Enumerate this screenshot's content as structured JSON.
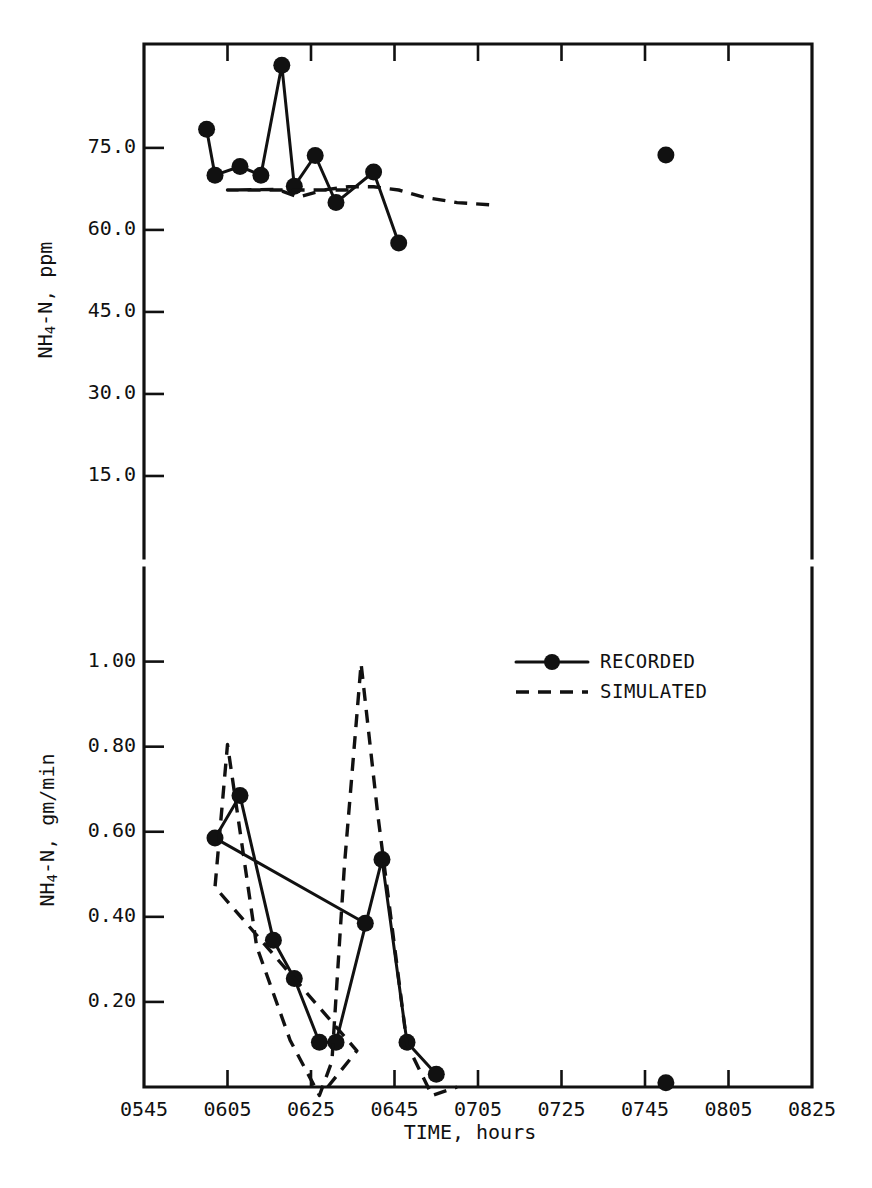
{
  "figure": {
    "background_color": "#ffffff",
    "ink_color": "#111111",
    "xlabel": "TIME, hours"
  },
  "legend": {
    "position": "upper-right-of-lower-panel",
    "entries": [
      {
        "label": "RECORDED",
        "style": "solid-with-circle-marker"
      },
      {
        "label": "SIMULATED",
        "style": "dashed"
      }
    ]
  },
  "chart_data": [
    {
      "type": "line",
      "panel": "top",
      "title": "",
      "xlabel": "",
      "ylabel": "NH4-N, ppm",
      "ylabel_parts": {
        "pre": "NH",
        "sub": "4",
        "post": "-N, ppm"
      },
      "x_tick_labels": [
        "0545",
        "0605",
        "0625",
        "0645",
        "0705",
        "0725",
        "0745",
        "0805",
        "0825"
      ],
      "x_tick_values": [
        545,
        605,
        625,
        645,
        705,
        725,
        745,
        805,
        825
      ],
      "x_ticks_visible": false,
      "y_tick_labels": [
        "75.0",
        "60.0",
        "45.0",
        "30.0",
        "15.0"
      ],
      "y_tick_values": [
        75.0,
        60.0,
        45.0,
        30.0,
        15.0
      ],
      "xlim": [
        545,
        825
      ],
      "ylim": [
        0,
        94
      ],
      "grid": false,
      "framed": true,
      "series": [
        {
          "name": "RECORDED",
          "style": "solid",
          "markers": true,
          "x": [
            600,
            602,
            608,
            613,
            618,
            621,
            626,
            631,
            640,
            646,
            652
          ],
          "y": [
            78.4,
            70.0,
            71.6,
            70.0,
            90.1,
            68.0,
            73.6,
            65.0,
            70.6,
            57.6
          ]
        },
        {
          "name": "RECORDED-isolated",
          "style": "points-only",
          "markers": true,
          "x": [
            750
          ],
          "y": [
            73.7
          ]
        },
        {
          "name": "SIMULATED",
          "style": "dashed",
          "markers": false,
          "x": [
            594,
            605,
            617,
            622,
            628,
            634,
            640,
            646,
            652,
            660,
            668
          ],
          "y": [
            67.3,
            67.3,
            67.4,
            66.0,
            67.3,
            67.9,
            67.9,
            67.3,
            66.0,
            65.0,
            64.6
          ]
        }
      ]
    },
    {
      "type": "line",
      "panel": "bottom",
      "title": "",
      "xlabel": "TIME, hours",
      "ylabel": "NH4-N, gm/min",
      "ylabel_parts": {
        "pre": "NH",
        "sub": "4",
        "post": "-N, gm/min"
      },
      "x_tick_labels": [
        "0545",
        "0605",
        "0625",
        "0645",
        "0705",
        "0725",
        "0745",
        "0805",
        "0825"
      ],
      "x_tick_values": [
        545,
        605,
        625,
        645,
        705,
        725,
        745,
        805,
        825
      ],
      "x_ticks_visible": true,
      "y_tick_labels": [
        "1.00",
        "0.80",
        "0.60",
        "0.40",
        "0.20"
      ],
      "y_tick_values": [
        1.0,
        0.8,
        0.6,
        0.4,
        0.2
      ],
      "xlim": [
        545,
        825
      ],
      "ylim": [
        0,
        1.22
      ],
      "grid": false,
      "framed": true,
      "series": [
        {
          "name": "RECORDED",
          "style": "solid",
          "markers": true,
          "x": [
            598,
            602,
            608,
            616,
            621,
            627,
            631,
            642,
            648,
            655
          ],
          "y": [
            0.385,
            0.585,
            0.685,
            0.345,
            0.255,
            0.105,
            0.105,
            0.535,
            0.105,
            0.03
          ]
        },
        {
          "name": "RECORDED-isolated",
          "style": "points-only",
          "markers": true,
          "x": [
            750
          ],
          "y": [
            0.01
          ]
        },
        {
          "name": "SIMULATED",
          "style": "dashed",
          "markers": false,
          "x": [
            589,
            596,
            602,
            605,
            612,
            620,
            627,
            630,
            633,
            637,
            641,
            648,
            654,
            660
          ],
          "y": [
            0.0,
            0.085,
            0.47,
            0.805,
            0.33,
            0.11,
            -0.02,
            0.06,
            0.52,
            0.995,
            0.64,
            0.1,
            -0.02,
            0.0
          ]
        }
      ]
    }
  ]
}
